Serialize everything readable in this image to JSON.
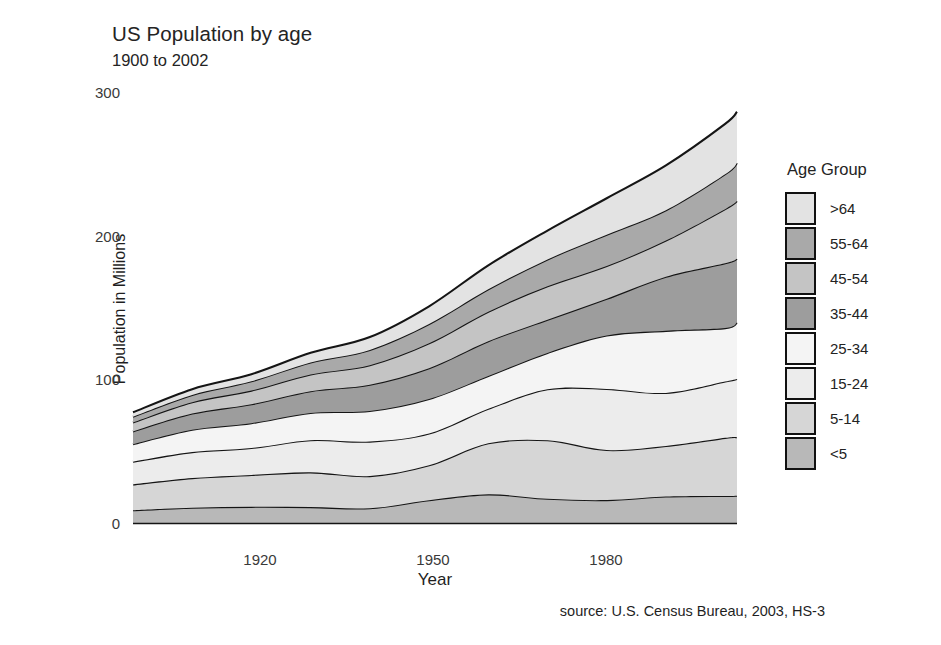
{
  "header": {
    "title": "US Population by age",
    "subtitle": "1900 to 2002"
  },
  "axes": {
    "y_title": "Population in Millions",
    "x_title": "Year",
    "y_ticks": [
      "0",
      "100",
      "200",
      "300"
    ],
    "x_ticks": [
      "1920",
      "1950",
      "1980"
    ]
  },
  "source": {
    "text": "source: U.S. Census Bureau, 2003, HS-3"
  },
  "legend": {
    "title": "Age Group",
    "items": [
      {
        "label": ">64",
        "color": "#e3e3e3"
      },
      {
        "label": "55-64",
        "color": "#a9a9a9"
      },
      {
        "label": "45-54",
        "color": "#c4c4c4"
      },
      {
        "label": "35-44",
        "color": "#9d9d9d"
      },
      {
        "label": "25-34",
        "color": "#f4f4f4"
      },
      {
        "label": "15-24",
        "color": "#ececec"
      },
      {
        "label": "5-14",
        "color": "#d6d6d6"
      },
      {
        "label": "<5",
        "color": "#b8b8b8"
      }
    ]
  },
  "chart_data": {
    "type": "area",
    "stacked": true,
    "title": "US Population by age",
    "subtitle": "1900 to 2002",
    "xlabel": "Year",
    "ylabel": "Population in Millions",
    "xlim": [
      1900,
      2002
    ],
    "ylim": [
      0,
      300
    ],
    "grid": false,
    "legend_position": "right",
    "legend_title": "Age Group",
    "x": [
      1900,
      1910,
      1920,
      1930,
      1940,
      1950,
      1960,
      1970,
      1980,
      1990,
      2000,
      2002
    ],
    "series": [
      {
        "name": "<5",
        "color": "#b8b8b8",
        "values": [
          9.2,
          11.0,
          11.6,
          11.4,
          10.6,
          16.2,
          20.3,
          17.2,
          16.3,
          18.8,
          19.2,
          19.4
        ]
      },
      {
        "name": "5-14",
        "color": "#d6d6d6",
        "values": [
          18.0,
          20.6,
          22.2,
          24.2,
          22.4,
          24.3,
          35.5,
          40.7,
          34.9,
          35.1,
          40.4,
          40.7
        ]
      },
      {
        "name": "15-24",
        "color": "#ececec",
        "values": [
          15.8,
          18.1,
          18.7,
          22.4,
          24.0,
          22.1,
          24.0,
          35.5,
          42.5,
          37.0,
          39.2,
          40.5
        ]
      },
      {
        "name": "25-34",
        "color": "#f4f4f4",
        "values": [
          12.2,
          15.6,
          17.3,
          19.0,
          21.3,
          24.0,
          22.9,
          25.3,
          37.1,
          43.2,
          37.2,
          39.3
        ]
      },
      {
        "name": "35-44",
        "color": "#9d9d9d",
        "values": [
          8.9,
          11.2,
          13.2,
          15.1,
          18.3,
          21.5,
          24.2,
          23.1,
          25.6,
          37.6,
          45.1,
          44.4
        ]
      },
      {
        "name": "45-54",
        "color": "#c4c4c4",
        "values": [
          6.2,
          7.9,
          9.5,
          11.6,
          13.6,
          17.3,
          20.5,
          23.3,
          22.8,
          25.2,
          37.7,
          40.1
        ]
      },
      {
        "name": "55-64",
        "color": "#a9a9a9",
        "values": [
          4.0,
          5.1,
          6.5,
          8.4,
          10.6,
          13.4,
          15.6,
          18.7,
          21.7,
          21.1,
          24.3,
          26.6
        ]
      },
      {
        "name": ">64",
        "color": "#e3e3e3",
        "values": [
          3.1,
          4.0,
          4.9,
          6.7,
          9.0,
          12.4,
          16.7,
          20.1,
          25.5,
          31.2,
          35.0,
          35.6
        ]
      }
    ],
    "totals": [
      77.4,
      93.5,
      103.9,
      118.8,
      129.8,
      151.2,
      179.7,
      203.9,
      226.4,
      249.2,
      278.1,
      286.6
    ]
  }
}
